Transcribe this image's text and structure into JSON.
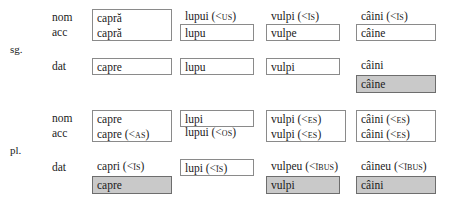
{
  "table": {
    "numbers": [
      {
        "id": "sg",
        "label": "sg.",
        "cases": {
          "nom": "nom",
          "acc": "acc",
          "dat": "dat"
        },
        "columns": [
          {
            "id": "capra",
            "nom_acc_box": {
              "boxed": true,
              "shaded": false,
              "nom": "capră",
              "acc": "capră"
            },
            "dat": {
              "boxed": true,
              "shaded": false,
              "text": "capre"
            },
            "dat_alt": null
          },
          {
            "id": "lup",
            "nom": {
              "boxed": false,
              "shaded": false,
              "text": "lupui (<",
              "sc": "us",
              "tail": ")"
            },
            "acc": {
              "boxed": true,
              "shaded": false,
              "text": "lupu"
            },
            "dat": {
              "boxed": true,
              "shaded": false,
              "text": "lupu"
            },
            "dat_alt": null
          },
          {
            "id": "vulpe",
            "nom": {
              "boxed": false,
              "shaded": false,
              "text": "vulpi (<",
              "sc": "īs",
              "tail": ")"
            },
            "acc": {
              "boxed": true,
              "shaded": false,
              "text": "vulpe"
            },
            "dat": {
              "boxed": true,
              "shaded": false,
              "text": "vulpi"
            },
            "dat_alt": null
          },
          {
            "id": "caine",
            "nom": {
              "boxed": false,
              "shaded": false,
              "text": "câini (<",
              "sc": "īs",
              "tail": ")"
            },
            "acc": {
              "boxed": true,
              "shaded": false,
              "text": "câine"
            },
            "dat": {
              "boxed": false,
              "shaded": false,
              "text": "câini"
            },
            "dat_alt": {
              "boxed": true,
              "shaded": true,
              "text": "câine"
            }
          }
        ]
      },
      {
        "id": "pl",
        "label": "pl.",
        "cases": {
          "nom": "nom",
          "acc": "acc",
          "dat": "dat"
        },
        "columns": [
          {
            "id": "capra",
            "nom_acc_box": {
              "boxed": true,
              "shaded": false,
              "nom": "capre",
              "acc": "capre (<",
              "acc_sc": "as",
              "acc_tail": ")"
            },
            "dat": {
              "boxed": false,
              "shaded": false,
              "text": "capri (<",
              "sc": "īs",
              "tail": ")"
            },
            "dat_alt": {
              "boxed": true,
              "shaded": true,
              "text": "capre"
            }
          },
          {
            "id": "lup",
            "nom": {
              "boxed": true,
              "shaded": false,
              "text": "lupi"
            },
            "acc": {
              "boxed": false,
              "shaded": false,
              "text": "lupui (<",
              "sc": "os",
              "tail": ")"
            },
            "dat": {
              "boxed": true,
              "shaded": false,
              "text": "lupi (<",
              "sc": "īs",
              "tail": ")"
            },
            "dat_alt": null
          },
          {
            "id": "vulpe",
            "nom_acc_box": {
              "boxed": true,
              "shaded": false,
              "nom": "vulpi (<",
              "nom_sc": "es",
              "nom_tail": ")",
              "acc": "vulpi (<",
              "acc_sc": "es",
              "acc_tail": ")"
            },
            "dat": {
              "boxed": false,
              "shaded": false,
              "text": "vulpeu (<",
              "sc": "ībus",
              "tail": ")"
            },
            "dat_alt": {
              "boxed": true,
              "shaded": true,
              "text": "vulpi"
            }
          },
          {
            "id": "caine",
            "nom_acc_box": {
              "boxed": true,
              "shaded": false,
              "nom": "câini (<",
              "nom_sc": "es",
              "nom_tail": ")",
              "acc": "câini (<",
              "acc_sc": "es",
              "acc_tail": ")"
            },
            "dat": {
              "boxed": false,
              "shaded": false,
              "text": "câineu (<",
              "sc": "ībus",
              "tail": ")"
            },
            "dat_alt": {
              "boxed": true,
              "shaded": true,
              "text": "câini"
            }
          }
        ]
      }
    ],
    "colors": {
      "box_border": "#8a8a8a",
      "shaded_fill": "#c9c9c9",
      "shaded_border": "#6d6d6d",
      "text": "#1a1a1a"
    }
  }
}
